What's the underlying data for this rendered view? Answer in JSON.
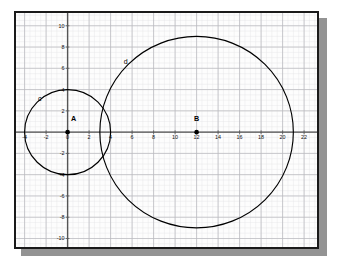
{
  "app": {
    "title": "Coordinate Plane with Two Circles"
  },
  "chart_data": {
    "type": "scatter",
    "title": "",
    "xlabel": "",
    "ylabel": "",
    "xlim": [
      -4.8,
      23.2
    ],
    "ylim": [
      -10.8,
      11.2
    ],
    "grid": true,
    "grid_minor_step": 0.5,
    "grid_major_step": 2,
    "legend": "none",
    "axis_color": "#555555",
    "curve_color": "#000000",
    "grid_minor_color": "#e3e3e6",
    "grid_major_color": "#b9b9bf",
    "xticks": [
      -4,
      -2,
      0,
      2,
      4,
      6,
      8,
      10,
      12,
      14,
      16,
      18,
      20,
      22
    ],
    "xtick_labels": [
      "-4",
      "-2",
      "0",
      "2",
      "4",
      "6",
      "8",
      "10",
      "12",
      "14",
      "16",
      "18",
      "20",
      "22"
    ],
    "yticks": [
      -10,
      -8,
      -6,
      -4,
      -2,
      2,
      4,
      6,
      8,
      10
    ],
    "ytick_labels": [
      "-10",
      "-8",
      "-6",
      "-4",
      "-2",
      "2",
      "4",
      "6",
      "8",
      "10"
    ],
    "circles": [
      {
        "name": "c",
        "label": "c",
        "center_label": "A",
        "cx": 0,
        "cy": 0,
        "r": 4,
        "label_x": -2.6,
        "label_y": 2.9,
        "color": "#000000",
        "stroke_width": 1.15
      },
      {
        "name": "d",
        "label": "d",
        "center_label": "B",
        "cx": 12,
        "cy": 0,
        "r": 9,
        "label_x": 5.4,
        "label_y": 6.4,
        "color": "#000000",
        "stroke_width": 1.15
      }
    ],
    "points": [
      {
        "name": "A",
        "label": "A",
        "x": 0,
        "y": 0,
        "label_dx": 0.55,
        "label_dy": 1.05
      },
      {
        "name": "B",
        "label": "B",
        "x": 12,
        "y": 0,
        "label_dx": 0.0,
        "label_dy": 1.05
      }
    ]
  }
}
